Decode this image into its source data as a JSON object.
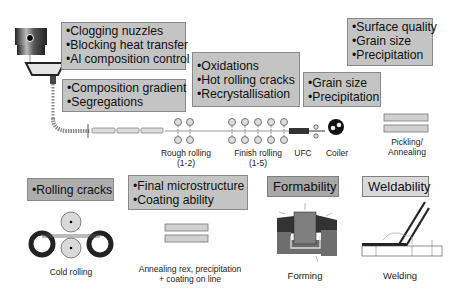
{
  "boxes": {
    "tundish": {
      "items": [
        "•Clogging nuzzles",
        "•Blocking heat transfer",
        "•Al composition control"
      ]
    },
    "casting": {
      "items": [
        "•Composition gradient",
        "•Segregations"
      ]
    },
    "hot_rolling": {
      "items": [
        "•Oxidations",
        "•Hot rolling cracks",
        "•Recrystallisation"
      ]
    },
    "cooling": {
      "items": [
        "•Grain size",
        "•Precipitation"
      ]
    },
    "pickling": {
      "items": [
        "•Surface quality",
        "•Grain size",
        "•Precipitation"
      ]
    },
    "cold_rolling": {
      "items": [
        "•Rolling cracks"
      ]
    },
    "annealing": {
      "items": [
        "•Final microstructure",
        "•Coating ability"
      ]
    }
  },
  "headings": {
    "formability": "Formability",
    "weldability": "Weldability"
  },
  "labels": {
    "rough_rolling": "Rough rolling",
    "rough_rolling_stands": "(1-2)",
    "finish_rolling": "Finish rolling",
    "finish_rolling_stands": "(1-5)",
    "ufc": "UFC",
    "coiler": "Coiler",
    "pickling_line1": "Pickling/",
    "pickling_line2": "Annealing",
    "cold_rolling": "Cold rolling",
    "annealing_line1": "Annealing rex, precipitation",
    "annealing_line2": "+ coating on line",
    "forming": "Forming",
    "welding": "Welding"
  },
  "colors": {
    "box_fill": "#c4c4c4",
    "box_border": "#8a8a8a",
    "roll_fill": "#d9d9d9"
  }
}
